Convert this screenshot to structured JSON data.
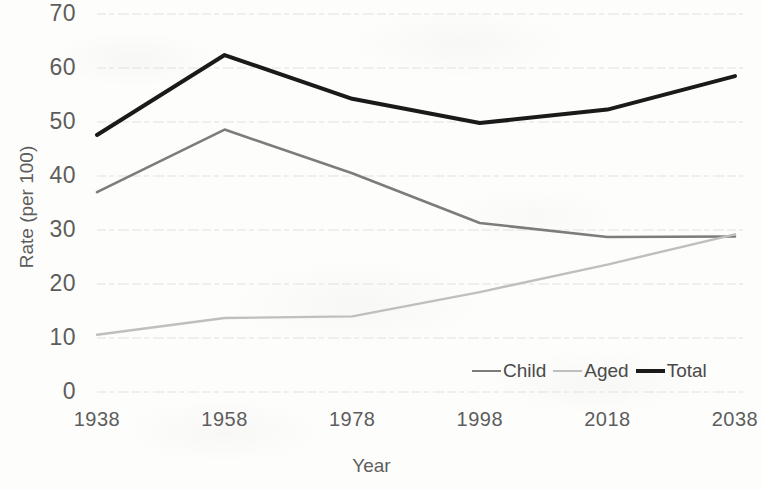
{
  "chart_data": {
    "type": "line",
    "title": "",
    "xlabel": "Year",
    "ylabel": "Rate (per 100)",
    "categories": [
      "1938",
      "1958",
      "1978",
      "1998",
      "2018",
      "2038"
    ],
    "x": [
      1938,
      1958,
      1978,
      1998,
      2018,
      2038
    ],
    "xlim": [
      1938,
      2038
    ],
    "ylim": [
      0,
      70
    ],
    "yticks": [
      "0",
      "10",
      "20",
      "30",
      "40",
      "50",
      "60",
      "70"
    ],
    "ytick_values": [
      0,
      10,
      20,
      30,
      40,
      50,
      60,
      70
    ],
    "grid": true,
    "legend_position": "inside-bottom-right",
    "series": [
      {
        "name": "Child",
        "color": "#7c7c7c",
        "width": 2.6,
        "values": [
          37.0,
          48.6,
          40.5,
          31.3,
          28.7,
          28.8
        ]
      },
      {
        "name": "Aged",
        "color": "#bfbfbf",
        "width": 2.4,
        "values": [
          10.6,
          13.7,
          14.0,
          18.5,
          23.6,
          29.2
        ]
      },
      {
        "name": "Total",
        "color": "#1a1a1a",
        "width": 4.0,
        "values": [
          47.6,
          62.4,
          54.3,
          49.8,
          52.3,
          58.5
        ]
      }
    ]
  },
  "legend": {
    "entries": [
      {
        "label": "Child"
      },
      {
        "label": "Aged"
      },
      {
        "label": "Total"
      }
    ]
  },
  "colors": {
    "grid": "#e2e2e0",
    "text": "#5d5d5d",
    "background": "#fdfdfc"
  }
}
